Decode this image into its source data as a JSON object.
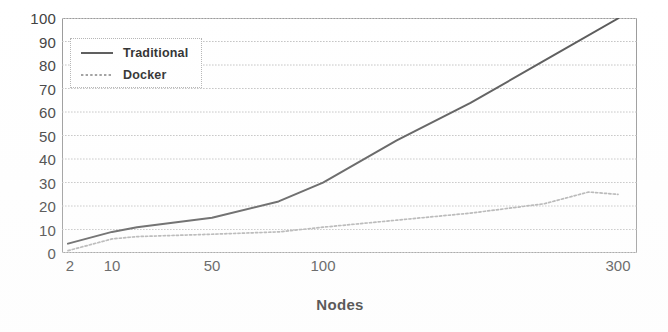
{
  "chart_data": {
    "type": "line",
    "title": "",
    "xlabel": "Nodes",
    "ylabel": "",
    "grid": true,
    "legend_position": "top-left",
    "xscale": "log-like-categorical",
    "x_tick_labels": [
      "2",
      "10",
      "50",
      "100",
      "300"
    ],
    "x_tick_values": [
      2,
      10,
      50,
      100,
      300
    ],
    "y_tick_labels": [
      "0",
      "10",
      "20",
      "30",
      "40",
      "50",
      "60",
      "70",
      "80",
      "90",
      "100"
    ],
    "y_tick_values": [
      0,
      10,
      20,
      30,
      40,
      50,
      60,
      70,
      80,
      90,
      100
    ],
    "ylim": [
      0,
      100
    ],
    "xlim": [
      2,
      300
    ],
    "series": [
      {
        "name": "Traditional",
        "style": "solid-dark",
        "color": "#595959",
        "x": [
          2,
          10,
          20,
          50,
          80,
          100,
          150,
          200,
          250,
          300
        ],
        "values": [
          4,
          9,
          11,
          15,
          22,
          30,
          48,
          64,
          82,
          100
        ]
      },
      {
        "name": "Docker",
        "style": "dotted-light",
        "color": "#b0b0b0",
        "x": [
          2,
          10,
          20,
          50,
          80,
          100,
          150,
          200,
          250,
          280,
          300
        ],
        "values": [
          1,
          6,
          7,
          8,
          9,
          11,
          14,
          17,
          21,
          26,
          25
        ]
      }
    ],
    "legend": [
      {
        "label": "Traditional",
        "swatch": "solid-line-swatch"
      },
      {
        "label": "Docker",
        "swatch": "dotted-line-swatch"
      }
    ],
    "colors": {
      "traditional": "#595959",
      "docker": "#b0b0b0",
      "gridline": "#c8c8c8",
      "frame": "#9a9a9a",
      "text": "#3a3a3a"
    }
  },
  "axis": {
    "x_title": "Nodes"
  }
}
